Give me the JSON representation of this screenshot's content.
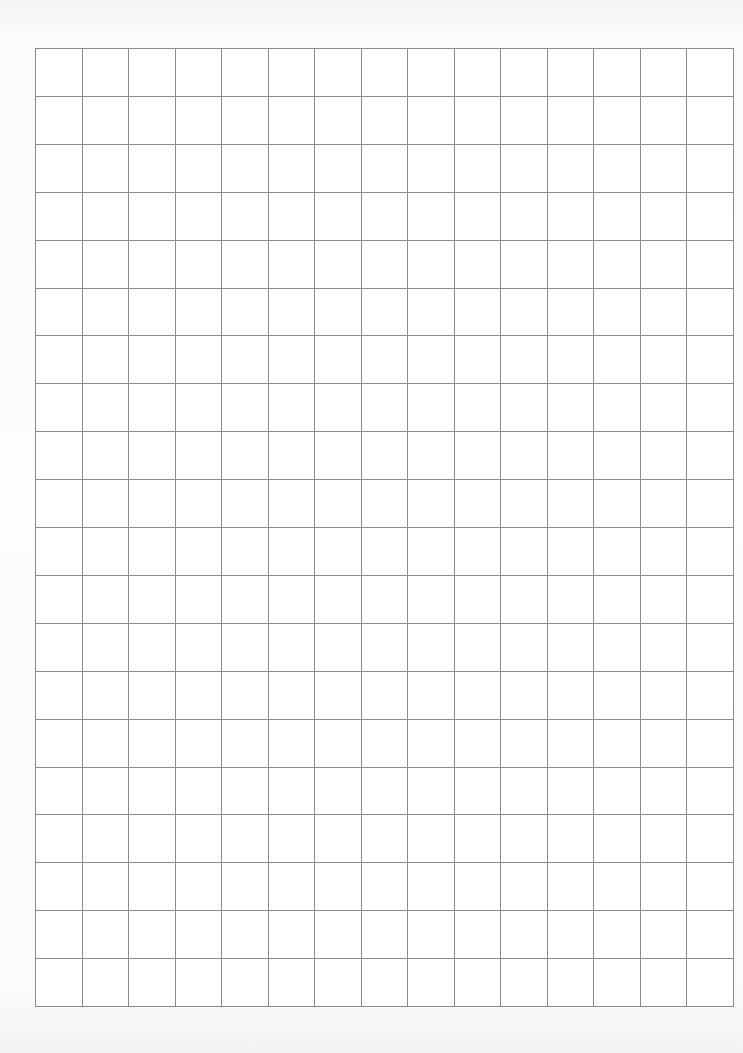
{
  "document": {
    "type": "grid-paper",
    "grid": {
      "columns": 15,
      "rows": 20,
      "line_color": "#8a8a8a",
      "background_color": "#ffffff"
    },
    "page_background_color": "#fbfbfb"
  }
}
